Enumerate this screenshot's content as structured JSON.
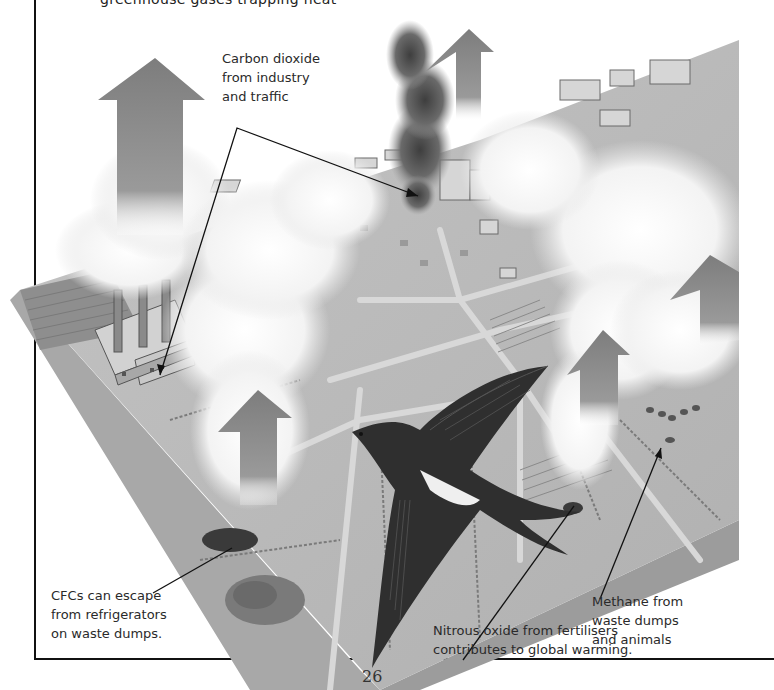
{
  "page": {
    "top_text_partial": "greenhouse gases trapping heat",
    "page_number": "26"
  },
  "illustration": {
    "description": "Isometric landscape with factory, town, fields, smoke plumes, upward arrows and a swallow in flight",
    "palette": {
      "ground": "#b9b9b9",
      "ground_edge": "#9a9a9a",
      "arrow": "#8a8a8a",
      "smoke": "#f2f2f2",
      "dark_smoke": "#5a5a5a",
      "bird_dark": "#2b2b2b",
      "bird_light": "#f0f0f0",
      "line": "#111111"
    },
    "icons": [
      "factory-icon",
      "bird-icon",
      "arrow-up-icon",
      "smoke-icon",
      "town-icon"
    ]
  },
  "annotations": {
    "carbon_dioxide": "Carbon dioxide\nfrom industry\nand traffic",
    "cfcs": "CFCs can escape\nfrom refrigerators\non waste dumps.",
    "methane": "Methane from\nwaste dumps\nand animals",
    "nitrous_oxide": "Nitrous oxide from fertilisers\ncontributes to global warming."
  }
}
